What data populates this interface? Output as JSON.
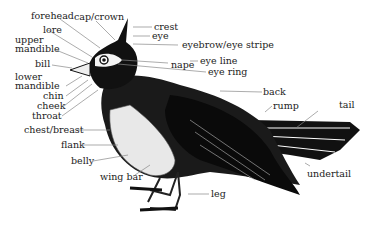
{
  "diagram": {
    "labels": {
      "forehead": "forehead",
      "cap_crown": "cap/crown",
      "lore": "lore",
      "upper_mandible_1": "upper",
      "upper_mandible_2": "mandible",
      "bill": "bill",
      "lower_mandible_1": "lower",
      "lower_mandible_2": "mandible",
      "chin": "chin",
      "cheek": "cheek",
      "throat": "throat",
      "chest_breast": "chest/breast",
      "flank": "flank",
      "belly": "belly",
      "wing_bar": "wing bar",
      "crest": "crest",
      "eye": "eye",
      "eyebrow": "eyebrow/eye stripe",
      "nape": "nape",
      "eye_line": "eye line",
      "eye_ring": "eye ring",
      "back": "back",
      "rump": "rump",
      "tail": "tail",
      "undertail": "undertail",
      "leg": "leg"
    }
  }
}
